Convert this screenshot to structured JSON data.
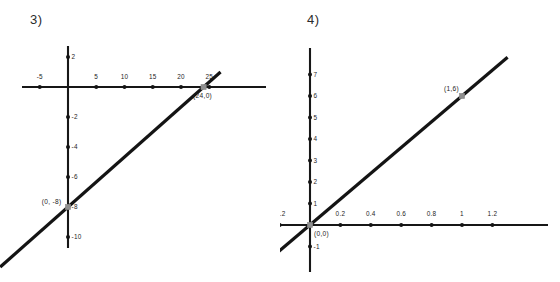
{
  "page": {
    "background_color": "#ffffff",
    "width": 560,
    "height": 282
  },
  "style": {
    "line_color": "#141414",
    "axis_color": "#171717",
    "marker_color": "#8f8f8f",
    "text_color": "#1d1d1d"
  },
  "problems": [
    {
      "number_label": "3)",
      "chart_data": {
        "type": "line",
        "title": "3)",
        "xlabel": "",
        "ylabel": "",
        "grid": false,
        "legend": null,
        "xlim": [
          -8,
          28
        ],
        "ylim": [
          -11,
          3
        ],
        "x_ticks": [
          -5,
          5,
          10,
          15,
          20,
          25
        ],
        "x_tick_labels": [
          "-5",
          "5",
          "10",
          "15",
          "20",
          "25"
        ],
        "y_ticks": [
          2,
          -2,
          -4,
          -6,
          -8,
          -10
        ],
        "y_tick_labels": [
          "2",
          "-2",
          "-4",
          "-6",
          "-8",
          "-10"
        ],
        "series": [
          {
            "name": "line-3",
            "slope": 0.3333,
            "intercept": -8,
            "x_start": -12,
            "x_end": 27,
            "points": [
              {
                "x": 0,
                "y": -8,
                "label": "(0, -8)",
                "marker": "square",
                "color": "#8f8f8f"
              },
              {
                "x": 24,
                "y": 0,
                "label": "(24,0)",
                "marker": "square",
                "color": "#8f8f8f"
              }
            ]
          }
        ],
        "annotations": [
          "(0, -8)",
          "(24,0)"
        ]
      }
    },
    {
      "number_label": "4)",
      "chart_data": {
        "type": "line",
        "title": "4)",
        "xlabel": "",
        "ylabel": "",
        "grid": false,
        "legend": null,
        "xlim": [
          -0.32,
          1.35
        ],
        "ylim": [
          -1.6,
          8
        ],
        "x_ticks": [
          -0.2,
          0.2,
          0.4,
          0.6,
          0.8,
          1,
          1.2
        ],
        "x_tick_labels": [
          "-0.2",
          "0.2",
          "0.4",
          "0.6",
          "0.8",
          "1",
          "1.2"
        ],
        "y_ticks": [
          7,
          6,
          5,
          4,
          3,
          2,
          1,
          -1
        ],
        "y_tick_labels": [
          "7",
          "6",
          "5",
          "4",
          "3",
          "2",
          "1",
          "-1"
        ],
        "series": [
          {
            "name": "line-4",
            "slope": 6,
            "intercept": 0,
            "x_start": -0.24,
            "x_end": 1.3,
            "points": [
              {
                "x": 0,
                "y": 0,
                "label": "(0,0)",
                "marker": "square",
                "color": "#8f8f8f"
              },
              {
                "x": 1,
                "y": 6,
                "label": "(1,6)",
                "marker": "square",
                "color": "#8f8f8f"
              }
            ]
          }
        ],
        "annotations": [
          "(0,0)",
          "(1,6)"
        ]
      }
    }
  ]
}
